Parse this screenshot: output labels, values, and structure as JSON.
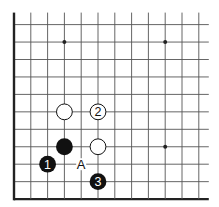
{
  "diagram": {
    "type": "go-board-corner",
    "grid": {
      "columns": 12,
      "rows": 11,
      "x0": 14,
      "dx": 16.8,
      "y0": 24.6,
      "dy": 17.45,
      "open_top_extend": 12,
      "open_right_extend": 10,
      "edges": [
        "left",
        "bottom"
      ]
    },
    "star_points": [
      {
        "col": 3,
        "row": 1
      },
      {
        "col": 9,
        "row": 1
      },
      {
        "col": 9,
        "row": 7
      }
    ],
    "stones": [
      {
        "col": 3,
        "row": 5,
        "color": "white",
        "label": ""
      },
      {
        "col": 5,
        "row": 5,
        "color": "white",
        "label": "2"
      },
      {
        "col": 3,
        "row": 7,
        "color": "black",
        "label": ""
      },
      {
        "col": 5,
        "row": 7,
        "color": "white",
        "label": ""
      },
      {
        "col": 2,
        "row": 8,
        "color": "black",
        "label": "1"
      },
      {
        "col": 5,
        "row": 9,
        "color": "black",
        "label": "3"
      }
    ],
    "markers": [
      {
        "col": 4,
        "row": 8,
        "label": "A"
      }
    ],
    "colors": {
      "line": "#555555",
      "edge": "#222222",
      "black_stone": "#111111",
      "white_stone": "#ffffff",
      "background": "#ffffff"
    }
  }
}
